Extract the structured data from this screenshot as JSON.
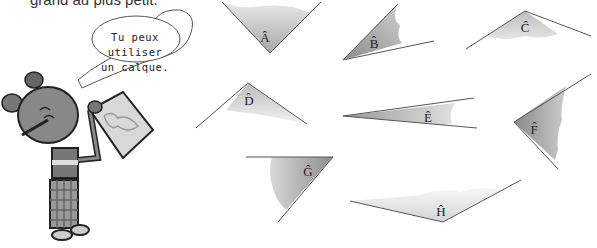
{
  "instruction": {
    "text": "grand au plus petit."
  },
  "bubble": {
    "line1": "Tu peux utiliser",
    "line2": "un calque."
  },
  "angles": [
    {
      "label": "Â",
      "id": "A"
    },
    {
      "label": "B̂",
      "id": "B"
    },
    {
      "label": "Ĉ",
      "id": "C"
    },
    {
      "label": "D̂",
      "id": "D"
    },
    {
      "label": "Ê",
      "id": "E"
    },
    {
      "label": "F̂",
      "id": "F"
    },
    {
      "label": "Ĝ",
      "id": "G"
    },
    {
      "label": "Ĥ",
      "id": "H"
    }
  ],
  "colors": {
    "fill_dark": "#9a9a9a",
    "fill_light": "#e4e4e4",
    "line": "#555555"
  }
}
